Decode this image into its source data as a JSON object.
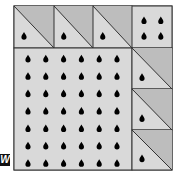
{
  "diagram": {
    "type": "area-model-quilt",
    "colors": {
      "light_fill": "#d9d9d9",
      "dark_fill": "#bdbdbd",
      "stroke": "#333333",
      "drop": "#000000",
      "background": "#ffffff"
    },
    "outer_box": {
      "x": 14,
      "y": 6,
      "w": 158,
      "h": 164
    },
    "top_row": [
      {
        "name": "triangle-tile-1",
        "x": 14,
        "y": 6,
        "w": 40,
        "h": 42,
        "drops": 1
      },
      {
        "name": "triangle-tile-2",
        "x": 54,
        "y": 6,
        "w": 39,
        "h": 42,
        "drops": 1
      },
      {
        "name": "triangle-tile-3",
        "x": 93,
        "y": 6,
        "w": 39,
        "h": 42,
        "drops": 1
      },
      {
        "name": "corner-square",
        "x": 132,
        "y": 6,
        "w": 40,
        "h": 42,
        "drops": 4
      }
    ],
    "big_square": {
      "x": 14,
      "y": 48,
      "w": 118,
      "h": 122,
      "rows": 7,
      "cols": 6,
      "drops": 42
    },
    "right_column": [
      {
        "name": "triangle-tile-4",
        "x": 132,
        "y": 48,
        "w": 40,
        "h": 41,
        "drops": 1
      },
      {
        "name": "triangle-tile-5",
        "x": 132,
        "y": 89,
        "w": 40,
        "h": 41,
        "drops": 1
      },
      {
        "name": "triangle-tile-6",
        "x": 132,
        "y": 130,
        "w": 40,
        "h": 40,
        "drops": 1
      }
    ],
    "total_drops": 52
  },
  "watermark": {
    "label": "W"
  }
}
